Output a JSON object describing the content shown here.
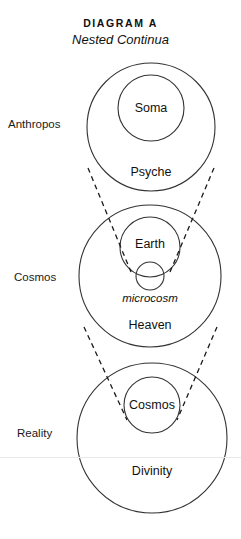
{
  "page": {
    "width": 241,
    "height": 539,
    "background": "#ffffff",
    "stroke_color": "#333333",
    "dash_color": "#1a1a1a",
    "rule_color": "#e9e9e9"
  },
  "title": {
    "main": "DIAGRAM A",
    "subtitle": "Nested Continua"
  },
  "row_labels": [
    {
      "name": "anthropos",
      "text": "Anthropos",
      "x": 8,
      "y": 118
    },
    {
      "name": "cosmos",
      "text": "Cosmos",
      "x": 14,
      "y": 271
    },
    {
      "name": "reality",
      "text": "Reality",
      "x": 17,
      "y": 427
    }
  ],
  "groups": [
    {
      "name": "anthropos",
      "row_label": "Anthropos",
      "outer": {
        "label": "Psyche",
        "cx": 151,
        "cy": 127,
        "r": 64,
        "label_x": 151,
        "label_y": 172
      },
      "inner": {
        "label": "Soma",
        "cx": 151,
        "cy": 108,
        "r": 33,
        "label_x": 151,
        "label_y": 108
      }
    },
    {
      "name": "cosmos",
      "row_label": "Cosmos",
      "outer": {
        "label": "Heaven",
        "cx": 150,
        "cy": 276,
        "r": 71,
        "label_x": 150,
        "label_y": 325
      },
      "inner": {
        "label": "Earth",
        "cx": 150,
        "cy": 247,
        "r": 30,
        "label_x": 150,
        "label_y": 244
      },
      "micro": {
        "label": "microcosm",
        "cx": 150,
        "cy": 276,
        "r": 14,
        "label_x": 150,
        "label_y": 298
      }
    },
    {
      "name": "reality",
      "row_label": "Reality",
      "outer": {
        "label": "Divinity",
        "cx": 152,
        "cy": 438,
        "r": 75,
        "label_x": 152,
        "label_y": 471
      },
      "inner": {
        "label": "Cosmos",
        "cx": 152,
        "cy": 405,
        "r": 28,
        "label_x": 152,
        "label_y": 405
      }
    }
  ],
  "connectors": [
    {
      "name": "anthropos-to-cosmos-left",
      "x1": 88,
      "y1": 168,
      "x2": 131,
      "y2": 272
    },
    {
      "name": "anthropos-to-cosmos-right",
      "x1": 214,
      "y1": 168,
      "x2": 170,
      "y2": 272
    },
    {
      "name": "cosmos-to-reality-left",
      "x1": 84,
      "y1": 327,
      "x2": 127,
      "y2": 420
    },
    {
      "name": "cosmos-to-reality-right",
      "x1": 217,
      "y1": 327,
      "x2": 177,
      "y2": 420
    }
  ],
  "baseline_rule": {
    "name": "page-rule",
    "y": 457
  }
}
